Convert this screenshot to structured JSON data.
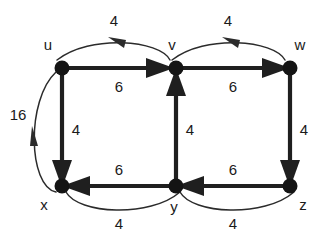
{
  "figure": {
    "type": "directed-weighted-graph",
    "background_color": "#ffffff",
    "node_color": "#141414",
    "thick_edge_color": "#1f1f1f",
    "thin_arc_color": "#2b2b2b",
    "label_color": "#1a1a1a"
  },
  "nodes": [
    {
      "id": "u",
      "label": "u",
      "x": 62,
      "y": 68,
      "label_x": 48,
      "label_y": 50
    },
    {
      "id": "v",
      "label": "v",
      "x": 176,
      "y": 68,
      "label_x": 172,
      "label_y": 50
    },
    {
      "id": "w",
      "label": "w",
      "x": 290,
      "y": 68,
      "label_x": 297,
      "label_y": 50
    },
    {
      "id": "x",
      "label": "x",
      "x": 62,
      "y": 186,
      "label_x": 44,
      "label_y": 208
    },
    {
      "id": "y",
      "label": "y",
      "x": 176,
      "y": 186,
      "label_x": 172,
      "label_y": 210
    },
    {
      "id": "z",
      "label": "z",
      "x": 290,
      "y": 186,
      "label_x": 300,
      "label_y": 208
    }
  ],
  "edges": [
    {
      "id": "u-v",
      "from": "u",
      "to": "v",
      "weight": "6",
      "style": "straight-thick",
      "weight_x": 119,
      "weight_y": 92
    },
    {
      "id": "v-w",
      "from": "v",
      "to": "w",
      "weight": "6",
      "style": "straight-thick",
      "weight_x": 233,
      "weight_y": 92
    },
    {
      "id": "v-u",
      "from": "v",
      "to": "u",
      "weight": "4",
      "style": "curved-thin-top",
      "weight_x": 114,
      "weight_y": 24
    },
    {
      "id": "w-v",
      "from": "w",
      "to": "v",
      "weight": "4",
      "style": "curved-thin-top",
      "weight_x": 228,
      "weight_y": 24
    },
    {
      "id": "u-x",
      "from": "u",
      "to": "x",
      "weight": "4",
      "style": "straight-thick",
      "weight_x": 74,
      "weight_y": 132
    },
    {
      "id": "y-v",
      "from": "y",
      "to": "v",
      "weight": "4",
      "style": "straight-thick",
      "weight_x": 188,
      "weight_y": 132
    },
    {
      "id": "w-z",
      "from": "w",
      "to": "z",
      "weight": "4",
      "style": "straight-thick",
      "weight_x": 302,
      "weight_y": 132
    },
    {
      "id": "x-u",
      "from": "x",
      "to": "u",
      "weight": "16",
      "style": "curved-thin-left",
      "weight_x": 14,
      "weight_y": 118
    },
    {
      "id": "y-x",
      "from": "y",
      "to": "x",
      "weight": "6",
      "style": "straight-thick",
      "weight_x": 119,
      "weight_y": 175
    },
    {
      "id": "z-y",
      "from": "z",
      "to": "y",
      "weight": "6",
      "style": "straight-thick",
      "weight_x": 233,
      "weight_y": 175
    },
    {
      "id": "x-y",
      "from": "x",
      "to": "y",
      "weight": "4",
      "style": "curved-thin-bottom",
      "weight_x": 119,
      "weight_y": 228
    },
    {
      "id": "y-z",
      "from": "y",
      "to": "z",
      "weight": "4",
      "style": "curved-thin-bottom",
      "weight_x": 233,
      "weight_y": 228
    }
  ]
}
